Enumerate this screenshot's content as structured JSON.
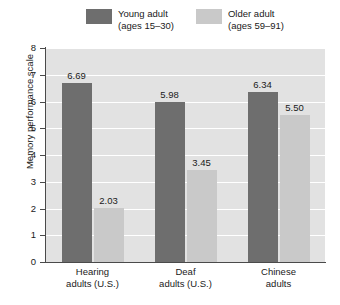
{
  "chart_data": {
    "type": "bar",
    "title": "",
    "xlabel": "",
    "ylabel": "Memory performance scale",
    "ylim": [
      0,
      8
    ],
    "yticks": [
      0,
      1,
      2,
      3,
      4,
      5,
      6,
      7,
      8
    ],
    "grid": true,
    "legend_position": "top",
    "categories": [
      "Hearing adults (U.S.)",
      "Deaf adults (U.S.)",
      "Chinese adults"
    ],
    "category_lines": [
      [
        "Hearing",
        "adults (U.S.)"
      ],
      [
        "Deaf",
        "adults (U.S.)"
      ],
      [
        "Chinese",
        "adults"
      ]
    ],
    "series": [
      {
        "name": "Young adult",
        "sublabel": "(ages 15–30)",
        "color": "#6e6e6e",
        "values": [
          6.69,
          5.98,
          6.34
        ],
        "labels": [
          "6.69",
          "5.98",
          "6.34"
        ]
      },
      {
        "name": "Older adult",
        "sublabel": "(ages 59–91)",
        "color": "#c9c9c9",
        "values": [
          2.03,
          3.45,
          5.5
        ],
        "labels": [
          "2.03",
          "3.45",
          "5.50"
        ]
      }
    ]
  },
  "legend": {
    "entries": [
      {
        "label": "Young adult",
        "sublabel": "(ages 15–30)"
      },
      {
        "label": "Older adult",
        "sublabel": "(ages 59–91)"
      }
    ]
  },
  "axis": {
    "y_title": "Memory performance scale",
    "y_labels": [
      "8",
      "7",
      "6",
      "5",
      "4",
      "3",
      "2",
      "1",
      "0"
    ]
  },
  "colors": {
    "young_adult": "#6e6e6e",
    "older_adult": "#c9c9c9",
    "plot_background": "#e2e2e2",
    "gridline": "#ffffff",
    "axis": "#4a4a4a",
    "text": "#1a1a1a"
  }
}
